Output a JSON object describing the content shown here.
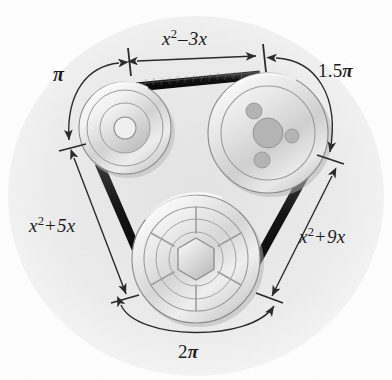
{
  "figure": {
    "canvas": {
      "width": 392,
      "height": 380
    },
    "background_color": "#fdfdfd",
    "inner_field_color": "#e9e9e9",
    "belt_color": "#1a1a1a",
    "line_color": "#2b2b2b",
    "pulley_edge_color": "#8d8d8d"
  },
  "labels": {
    "top_straight": {
      "base": "x",
      "exponent": "2",
      "operator": "–",
      "term": "3x",
      "text": "x² – 3x"
    },
    "left_straight": {
      "base": "x",
      "exponent": "2",
      "operator": "+",
      "term": "5x",
      "text": "x² + 5x"
    },
    "right_straight": {
      "base": "x",
      "exponent": "2",
      "operator": "+",
      "term": "9x",
      "text": "x² + 9x"
    },
    "upper_left_arc": {
      "coefficient": "",
      "symbol": "π",
      "text": "π"
    },
    "upper_right_arc": {
      "coefficient": "1.5",
      "symbol": "π",
      "text": "1.5π"
    },
    "bottom_arc": {
      "coefficient": "2",
      "symbol": "π",
      "text": "2π"
    }
  },
  "pulleys": [
    {
      "name": "left-pulley",
      "cx": 125,
      "cy": 128,
      "r": 46,
      "hub_type": "concentric-rings",
      "rings": [
        38,
        25,
        11
      ]
    },
    {
      "name": "right-pulley",
      "cx": 268,
      "cy": 133,
      "r": 60,
      "hub_type": "bolt-holes",
      "rings": [
        47
      ],
      "center_hole_r": 15,
      "bolt_holes": [
        {
          "dx": -14,
          "dy": -22,
          "r": 8
        },
        {
          "dx": 24,
          "dy": 3,
          "r": 7
        },
        {
          "dx": -6,
          "dy": 27,
          "r": 8
        }
      ]
    },
    {
      "name": "bottom-pulley",
      "cx": 196,
      "cy": 259,
      "r": 64,
      "hub_type": "spoked-hex",
      "rings": [
        52,
        40,
        27
      ],
      "spokes": 6,
      "hex_r": 20
    }
  ],
  "dimension_lines": [
    {
      "name": "top-dimension",
      "label_key": "top_straight",
      "orientation": "horizontal"
    },
    {
      "name": "left-dimension",
      "label_key": "left_straight",
      "orientation": "diagonal-left"
    },
    {
      "name": "right-dimension",
      "label_key": "right_straight",
      "orientation": "diagonal-right"
    }
  ],
  "arc_dimensions": [
    {
      "name": "upper-left-arc-dimension",
      "label_key": "upper_left_arc"
    },
    {
      "name": "upper-right-arc-dimension",
      "label_key": "upper_right_arc"
    },
    {
      "name": "bottom-arc-dimension",
      "label_key": "bottom_arc"
    }
  ]
}
